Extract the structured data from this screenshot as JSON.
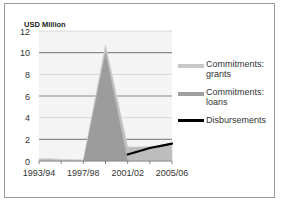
{
  "chart_data": {
    "type": "area",
    "title": "",
    "ylabel": "USD Million",
    "xlabel": "",
    "ylim": [
      0,
      12
    ],
    "yticks": [
      0,
      2,
      4,
      6,
      8,
      10,
      12
    ],
    "x": [
      "1993/94",
      "1994/95",
      "1995/96",
      "1996/97",
      "1997/98",
      "1998/99",
      "1999/00",
      "2000/01",
      "2001/02",
      "2002/03",
      "2003/04",
      "2004/05",
      "2005/06"
    ],
    "xtick_labels": [
      "1993/94",
      "1997/98",
      "2001/02",
      "2005/06"
    ],
    "grid": true,
    "legend_position": "right",
    "series": [
      {
        "name": "Commitments: grants",
        "type": "area",
        "color": "#b4b4b4",
        "values": [
          0.2,
          0.2,
          0.15,
          0.12,
          0.1,
          5.4,
          10.7,
          6.0,
          1.3,
          1.3,
          1.35,
          1.4,
          1.5
        ]
      },
      {
        "name": "Commitments: loans",
        "type": "area",
        "color": "#999999",
        "values": [
          0,
          0,
          0,
          0,
          0,
          5.0,
          10.0,
          5.0,
          0,
          0,
          0,
          0,
          0
        ]
      },
      {
        "name": "Disbursements",
        "type": "line",
        "color": "#000000",
        "values": [
          null,
          null,
          null,
          null,
          null,
          null,
          null,
          null,
          0.6,
          0.9,
          1.2,
          1.4,
          1.6
        ]
      }
    ]
  },
  "axis": {
    "unit_label": "USD Million",
    "y_labels": [
      "12",
      "10",
      "8",
      "6",
      "4",
      "2",
      "0"
    ],
    "x_labels": [
      "1993/94",
      "1997/98",
      "2001/02",
      "2005/06"
    ]
  },
  "legend": {
    "items": [
      {
        "label": "Commitments: grants",
        "color": "#b4b4b4"
      },
      {
        "label": "Commitments: loans",
        "color": "#999999"
      },
      {
        "label": "Disbursements",
        "color": "#000000"
      }
    ]
  }
}
